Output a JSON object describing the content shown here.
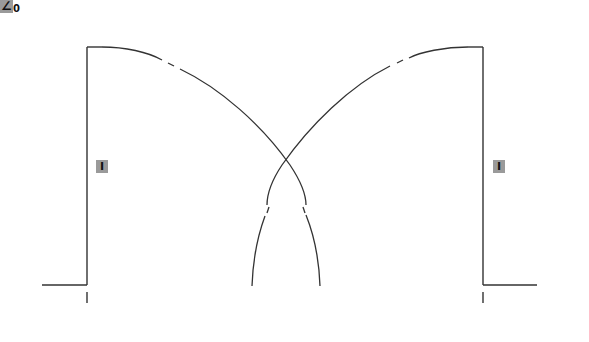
{
  "diagram": {
    "type": "waveform-overlap",
    "colors": {
      "background": "#ffffff",
      "stroke": "#333333",
      "label_fill": "#9a9a9a",
      "label_text": "#111111"
    },
    "labels": {
      "current_left": "I",
      "current_right": "I",
      "angle_symbol": "∠",
      "angle_subscript": "0"
    },
    "geometry": {
      "left_pulse": {
        "baseline": [
          [
            42,
            285
          ],
          [
            87,
            285
          ]
        ],
        "rise": [
          [
            87,
            285
          ],
          [
            87,
            47
          ]
        ],
        "top": [
          [
            87,
            47
          ],
          [
            100,
            47
          ]
        ],
        "tick": [
          [
            87,
            292
          ],
          [
            87,
            303
          ]
        ]
      },
      "right_pulse": {
        "baseline": [
          [
            483,
            285
          ],
          [
            537,
            285
          ]
        ],
        "rise": [
          [
            483,
            285
          ],
          [
            483,
            47
          ]
        ],
        "top": [
          [
            483,
            47
          ],
          [
            470,
            47
          ]
        ],
        "tick": [
          [
            483,
            292
          ],
          [
            483,
            303
          ]
        ]
      },
      "crossing_point": [
        286,
        161
      ]
    }
  }
}
